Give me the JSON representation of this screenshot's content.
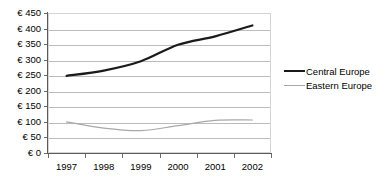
{
  "chart_data": {
    "type": "line",
    "title": "",
    "xlabel": "",
    "ylabel": "",
    "categories": [
      "1997",
      "1998",
      "1999",
      "2000",
      "2001",
      "2002"
    ],
    "ytick_labels": [
      "€ 450",
      "€ 400",
      "€ 350",
      "€ 300",
      "€ 250",
      "€ 200",
      "€ 150",
      "€ 100",
      "€ 50",
      "€ 0"
    ],
    "ytick_values": [
      450,
      400,
      350,
      300,
      250,
      200,
      150,
      100,
      50,
      0
    ],
    "ylim": [
      0,
      450
    ],
    "currency_symbol": "€",
    "grid": "horizontal",
    "legend_position": "right",
    "series": [
      {
        "name": "Central Europe",
        "color": "#1a1a1a",
        "line_width": 2.2,
        "values": [
          248,
          265,
          295,
          348,
          375,
          410
        ]
      },
      {
        "name": "Eastern Europe",
        "color": "#a8a8a8",
        "line_width": 1.2,
        "values": [
          100,
          80,
          72,
          88,
          105,
          106
        ]
      }
    ]
  },
  "legend": {
    "items": [
      {
        "label": "Central Europe",
        "swatch": "thick-black-line"
      },
      {
        "label": "Eastern Europe",
        "swatch": "thin-gray-line"
      }
    ]
  },
  "colors": {
    "central_europe": "#1a1a1a",
    "eastern_europe": "#a8a8a8",
    "gridline": "#bcbcbc",
    "plot_border": "#d4d4d4",
    "axis": "#5a5a5a",
    "background": "#ffffff",
    "text": "#000000"
  }
}
